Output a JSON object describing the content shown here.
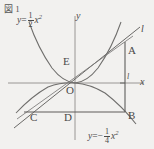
{
  "figure": {
    "number_label": "図 1",
    "type": "coordinate-geometry-diagram",
    "background_color": "#f2f1ef",
    "ink_color": "#4a4a4a",
    "axes": {
      "x_label": "x",
      "y_label": "y",
      "origin_label": "O",
      "x_axis_pixel_y": 83,
      "y_axis_pixel_x": 75
    },
    "equations": [
      {
        "id": "upward-parabola",
        "lhs": "y",
        "eq": "=",
        "sign": "",
        "numerator": "1",
        "denominator": "2",
        "variable": "x",
        "exponent": "2",
        "plain": "y = 1/2 x^2"
      },
      {
        "id": "downward-parabola",
        "lhs": "y",
        "eq": "=",
        "sign": "−",
        "numerator": "1",
        "denominator": "4",
        "variable": "x",
        "exponent": "2",
        "plain": "y = -1/4 x^2"
      }
    ],
    "line_label": "l",
    "tick_label": "l",
    "points": [
      {
        "name": "A",
        "label": "A",
        "x": 128,
        "y": 45
      },
      {
        "name": "B",
        "label": "B",
        "x": 128,
        "y": 110
      },
      {
        "name": "C",
        "label": "C",
        "x": 30,
        "y": 112
      },
      {
        "name": "D",
        "label": "D",
        "x": 72,
        "y": 112
      },
      {
        "name": "E",
        "label": "E",
        "x": 68,
        "y": 59
      },
      {
        "name": "O",
        "label": "O",
        "x": 70,
        "y": 88
      }
    ]
  }
}
